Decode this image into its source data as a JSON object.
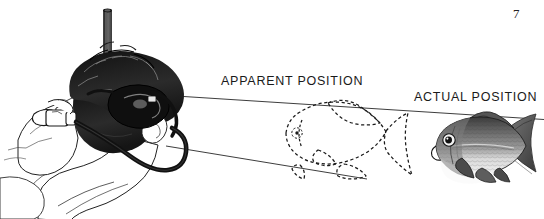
{
  "figure": {
    "page_number": "7",
    "background_color": "#ffffff",
    "ink_color": "#1a1a1a",
    "labels": {
      "apparent": "APPARENT POSITION",
      "actual": "ACTUAL POSITION"
    },
    "subjects": {
      "diver": "snorkeler-head-profile",
      "snorkel_tube": "snorkel-tube",
      "snorkel_hose": "snorkel-hose",
      "dive_mask": "dive-mask",
      "apparent_fish": "dashed-fish-outline",
      "actual_fish": "shaded-fish-illustration"
    },
    "sight_lines": {
      "upper": {
        "x1": 168,
        "y1": 96,
        "x2": 544,
        "y2": 119
      },
      "lower": {
        "x1": 166,
        "y1": 146,
        "x2": 367,
        "y2": 179
      }
    },
    "icons": {
      "snorkel": "snorkel-icon",
      "fish_dashed": "fish-outline-icon",
      "fish_solid": "fish-icon"
    }
  }
}
